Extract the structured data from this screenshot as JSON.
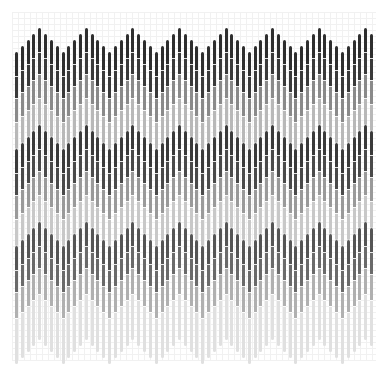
{
  "chart_data": {
    "type": "bar",
    "subtype": "stacked-zigzag",
    "title": "",
    "xlabel": "",
    "ylabel": "",
    "grid": true,
    "legend": null,
    "bar_count": 62,
    "bar_pitch_px": 5.82,
    "bar_width_px": 3,
    "first_bar_x": 15,
    "period_bars": 8,
    "peak_offset_bars": 4,
    "zigzag_step_px": 6,
    "zigzag_amplitude_steps": 4,
    "bands": [
      {
        "name": "band-1",
        "peak_top_y": 28,
        "segments": [
          {
            "length": 24,
            "color": "#2e2e2e"
          },
          {
            "length": 22,
            "color": "#3a3a3a"
          },
          {
            "length": 24,
            "color": "#8a8a8a"
          },
          {
            "length": 27,
            "color": "#b8b8b8"
          }
        ]
      },
      {
        "name": "band-2",
        "peak_top_y": 125,
        "segments": [
          {
            "length": 24,
            "color": "#3a3a3a"
          },
          {
            "length": 22,
            "color": "#4a4a4a"
          },
          {
            "length": 24,
            "color": "#9a9a9a"
          },
          {
            "length": 27,
            "color": "#c8c8c8"
          }
        ]
      },
      {
        "name": "band-3",
        "peak_top_y": 222,
        "segments": [
          {
            "length": 24,
            "color": "#555555"
          },
          {
            "length": 22,
            "color": "#6a6a6a"
          },
          {
            "length": 26,
            "color": "#b0b0b0"
          },
          {
            "length": 46,
            "color": "#e0e0e0"
          }
        ]
      }
    ],
    "grid_spacing_px": 6,
    "colors": {
      "background": "#ffffff",
      "grid": "#f1f1f1"
    }
  }
}
